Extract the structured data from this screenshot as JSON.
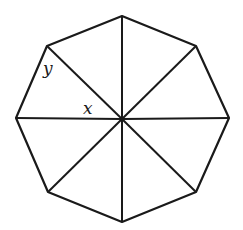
{
  "diagram": {
    "stroke_color": "#1a1a1a",
    "background": "#ffffff",
    "center": [
      122,
      119
    ],
    "vertices": [
      [
        122,
        16
      ],
      [
        196,
        46
      ],
      [
        229,
        118
      ],
      [
        196,
        192
      ],
      [
        122,
        222
      ],
      [
        48,
        192
      ],
      [
        16,
        118
      ],
      [
        47,
        46
      ]
    ],
    "labels": [
      {
        "text": "y",
        "x": 43,
        "y": 57,
        "meaning": "angle at top-left vertex"
      },
      {
        "text": "x",
        "x": 83,
        "y": 101,
        "meaning": "central angle"
      }
    ]
  }
}
